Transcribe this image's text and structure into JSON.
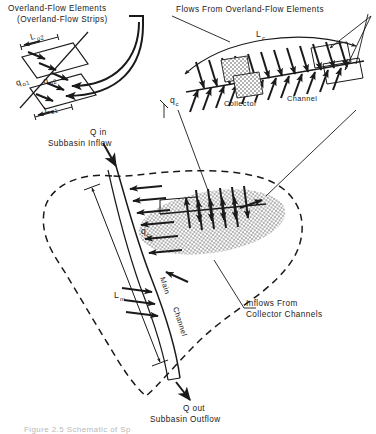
{
  "figure": {
    "domain_note": "hydrologic subbasin schematic line drawing",
    "caption_partial": "Figure 2.5  Schematic of Sp",
    "labels": {
      "overland_title_line1": "Overland-Flow Elements",
      "overland_title_line2": "(Overland-Flow Strips)",
      "flows_from_title": "Flows From Overland-Flow Elements",
      "q_in_line1": "Q in",
      "q_in_line2": "Subbasin Inflow",
      "q_out_line1": "Q out",
      "q_out_line2": "Subbasin Outflow",
      "inflows_line1": "Inflows From",
      "inflows_line2": "Collector Channels",
      "collector": "Collector",
      "channel": "Channel",
      "main_rot": "Main",
      "channel_rot": "Channel"
    },
    "symbols": {
      "L_o2": {
        "base": "L",
        "sub": "o2"
      },
      "L_o1": {
        "base": "L",
        "sub": "o1"
      },
      "q_o1": {
        "base": "q",
        "sub": "o1"
      },
      "q_o2": {
        "base": "q",
        "sub": "o2"
      },
      "L_c": {
        "base": "L",
        "sub": "c"
      },
      "q_c_top": {
        "base": "q",
        "sub": "c"
      },
      "q_c_basin": {
        "base": "q",
        "sub": "c"
      },
      "L_m": {
        "base": "L",
        "sub": "m"
      }
    },
    "colors": {
      "ink": "#1a1a1a",
      "paper": "#ffffff",
      "stipple": "#4a4a4a",
      "caption_faded": "#b9b9b9"
    }
  }
}
